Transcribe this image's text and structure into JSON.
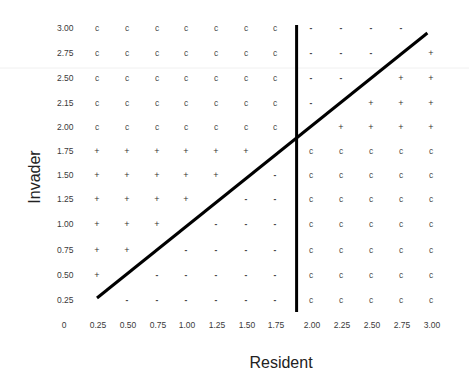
{
  "chart_data": {
    "type": "scatter",
    "title": "",
    "xlabel": "Resident",
    "ylabel": "Invader",
    "grid": false,
    "legend": "none",
    "x_origin_label": "0",
    "x_values": [
      0.25,
      0.5,
      0.75,
      1.0,
      1.25,
      1.5,
      1.75,
      2.0,
      2.25,
      2.5,
      2.75,
      3.0
    ],
    "x_tick_labels": [
      "0.25",
      "0.50",
      "0.75",
      "1.00",
      "1.25",
      "1.50",
      "1.75",
      "2.00",
      "2.25",
      "2.50",
      "2.75",
      "3.00"
    ],
    "y_values": [
      3.0,
      2.75,
      2.5,
      2.25,
      2.0,
      1.75,
      1.5,
      1.25,
      1.0,
      0.75,
      0.5,
      0.25
    ],
    "y_tick_labels": [
      "3.00",
      "2.75",
      "2.50",
      "2.15",
      "2.00",
      "1.75",
      "1.50",
      "1.25",
      "1.00",
      "0.75",
      "0.50",
      "0.25"
    ],
    "rows": [
      {
        "y_label": "3.00",
        "cells": [
          "c",
          "c",
          "c",
          "c",
          "c",
          "c",
          "c",
          "-",
          "-",
          "-",
          "-",
          ""
        ]
      },
      {
        "y_label": "2.75",
        "cells": [
          "c",
          "c",
          "c",
          "c",
          "c",
          "c",
          "c",
          "-",
          "-",
          "-",
          "",
          "+"
        ]
      },
      {
        "y_label": "2.50",
        "cells": [
          "c",
          "c",
          "c",
          "c",
          "c",
          "c",
          "c",
          "-",
          "-",
          "",
          "+",
          "+"
        ]
      },
      {
        "y_label": "2.15",
        "cells": [
          "c",
          "c",
          "c",
          "c",
          "c",
          "c",
          "c",
          "-",
          "",
          "+",
          "+",
          "+"
        ]
      },
      {
        "y_label": "2.00",
        "cells": [
          "c",
          "c",
          "c",
          "c",
          "c",
          "c",
          "c",
          "",
          "+",
          "+",
          "+",
          "+"
        ]
      },
      {
        "y_label": "1.75",
        "cells": [
          "+",
          "+",
          "+",
          "+",
          "+",
          "+",
          "",
          "c",
          "c",
          "c",
          "c",
          "c"
        ]
      },
      {
        "y_label": "1.50",
        "cells": [
          "+",
          "+",
          "+",
          "+",
          "+",
          "",
          "-",
          "c",
          "c",
          "c",
          "c",
          "c"
        ]
      },
      {
        "y_label": "1.25",
        "cells": [
          "+",
          "+",
          "+",
          "+",
          "",
          "-",
          "-",
          "c",
          "c",
          "c",
          "c",
          "c"
        ]
      },
      {
        "y_label": "1.00",
        "cells": [
          "+",
          "+",
          "+",
          "",
          "-",
          "-",
          "-",
          "c",
          "c",
          "c",
          "c",
          "c"
        ]
      },
      {
        "y_label": "0.75",
        "cells": [
          "+",
          "+",
          "",
          "-",
          "-",
          "-",
          "-",
          "c",
          "c",
          "c",
          "c",
          "c"
        ]
      },
      {
        "y_label": "0.50",
        "cells": [
          "+",
          "",
          "-",
          "-",
          "-",
          "-",
          "-",
          "c",
          "c",
          "c",
          "c",
          "c"
        ]
      },
      {
        "y_label": "0.25",
        "cells": [
          "",
          "-",
          "-",
          "-",
          "-",
          "-",
          "-",
          "c",
          "c",
          "c",
          "c",
          "c"
        ]
      }
    ],
    "lines": [
      {
        "name": "diagonal-line",
        "from": [
          0.25,
          0.27
        ],
        "to": [
          2.97,
          2.95
        ]
      },
      {
        "name": "vertical-line",
        "from": [
          1.9,
          0.13
        ],
        "to": [
          1.9,
          3.03
        ]
      }
    ]
  }
}
